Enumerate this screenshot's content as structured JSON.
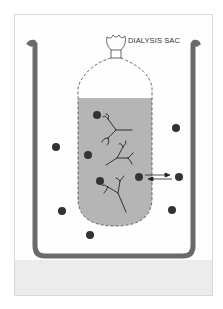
{
  "diagram": {
    "labels": {
      "sac": "DIALYSIS SAC"
    },
    "colors": {
      "beaker_wall": "#6a6a6a",
      "sac_fluid": "#b5b5b5",
      "floor": "#ececec",
      "particle": "#333333",
      "macromolecule": "#222222"
    },
    "small_molecules_inside": [
      {
        "x": 97,
        "y": 115
      },
      {
        "x": 88,
        "y": 155
      },
      {
        "x": 100,
        "y": 181
      },
      {
        "x": 139,
        "y": 177
      }
    ],
    "small_molecules_outside": [
      {
        "x": 56,
        "y": 147
      },
      {
        "x": 176,
        "y": 128
      },
      {
        "x": 179,
        "y": 177
      },
      {
        "x": 172,
        "y": 210
      },
      {
        "x": 62,
        "y": 211
      },
      {
        "x": 90,
        "y": 235
      }
    ],
    "arrows": [
      {
        "from": "inside",
        "to": "outside",
        "direction": "right"
      },
      {
        "from": "outside",
        "to": "inside",
        "direction": "left"
      }
    ]
  }
}
